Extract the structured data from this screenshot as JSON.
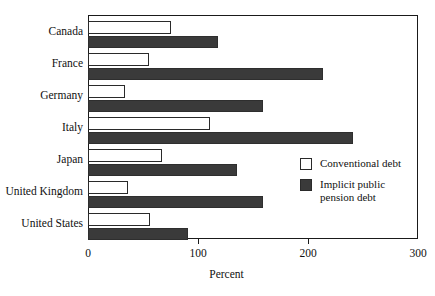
{
  "chart_data": {
    "type": "bar",
    "orientation": "horizontal",
    "title": "",
    "xlabel": "Percent",
    "ylabel": "",
    "xlim": [
      0,
      300
    ],
    "xticks": [
      0,
      100,
      200,
      300
    ],
    "xtick_labels": [
      "0",
      "100",
      "200",
      "300"
    ],
    "grid": false,
    "legend_position": "inside-right",
    "categories": [
      "Canada",
      "France",
      "Germany",
      "Italy",
      "Japan",
      "United Kingdom",
      "United States"
    ],
    "series": [
      {
        "name": "Conventional debt",
        "color": "#ffffff",
        "edge_color": "#2a2a2a",
        "values": [
          75,
          55,
          34,
          111,
          67,
          36,
          56
        ]
      },
      {
        "name": "Implicit public\npension debt",
        "color": "#3a3a3a",
        "edge_color": "#2e2e2e",
        "values": [
          118,
          214,
          159,
          241,
          135,
          159,
          91
        ]
      }
    ]
  },
  "legend": {
    "entries": [
      {
        "label": "Conventional debt",
        "swatch": "light"
      },
      {
        "label": "Implicit public\npension debt",
        "swatch": "dark"
      }
    ]
  },
  "colors": {
    "conventional_debt": "#ffffff",
    "implicit_pension_debt": "#3a3a3a",
    "axis": "#1a1a1a",
    "background": "#ffffff"
  }
}
